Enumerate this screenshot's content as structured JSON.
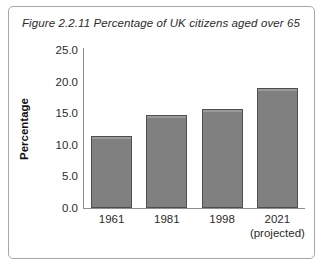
{
  "figure": {
    "title": "Figure 2.2.11 Percentage of UK citizens aged over 65"
  },
  "chart_data": {
    "type": "bar",
    "title": "Figure 2.2.11 Percentage of UK citizens aged over 65",
    "xlabel": "",
    "ylabel": "Percentage",
    "categories": [
      "1961",
      "1981",
      "1998",
      "2021"
    ],
    "category_sublabels": [
      "",
      "",
      "",
      "(projected)"
    ],
    "values": [
      11.4,
      14.7,
      15.7,
      19.0
    ],
    "ylim": [
      0.0,
      25.0
    ],
    "ytick_labels": [
      "25.0",
      "20.0",
      "15.0",
      "10.0",
      "5.0",
      "0.0"
    ],
    "ytick_values": [
      25.0,
      20.0,
      15.0,
      10.0,
      5.0,
      0.0
    ],
    "grid": false,
    "legend": null,
    "bar_color": "#808080",
    "bar_border_color": "#4e4e4e",
    "axis_color": "#8e8e8e",
    "frame_color": "#a8a8a8",
    "text_color": "#2b2b2b"
  }
}
